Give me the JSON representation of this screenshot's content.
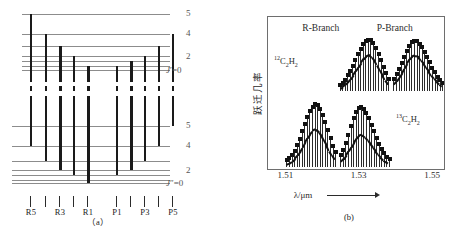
{
  "figure": {
    "panel_a": {
      "caption": "（a）",
      "upper_state_labels": [
        {
          "text": "5",
          "level_index": 0
        },
        {
          "text": "4",
          "level_index": 1
        },
        {
          "text": "2",
          "level_index": 3
        }
      ],
      "upper_j_label_italic": "J",
      "upper_j_label_prime": "′",
      "upper_j_label_value": "=0",
      "lower_state_labels": [
        {
          "text": "5",
          "level_index": 0
        },
        {
          "text": "4",
          "level_index": 1
        },
        {
          "text": "2",
          "level_index": 3
        }
      ],
      "lower_j_label_italic": "J",
      "lower_j_label_prime": "″",
      "lower_j_label_value": "=0",
      "transition_labels": [
        "R5",
        "",
        "R3",
        "",
        "R1",
        "P1",
        "",
        "P3",
        "",
        "P5"
      ],
      "upper_levels": [
        {
          "y": 14,
          "x": 22,
          "w": 148
        },
        {
          "y": 34,
          "x": 22,
          "w": 148
        },
        {
          "y": 46,
          "x": 22,
          "w": 148
        },
        {
          "y": 56,
          "x": 22,
          "w": 148
        },
        {
          "y": 61,
          "x": 22,
          "w": 148
        },
        {
          "y": 66,
          "x": 22,
          "w": 148
        },
        {
          "y": 70,
          "x": 22,
          "w": 148
        }
      ],
      "lower_levels": [
        {
          "y": 126,
          "x": 12,
          "w": 158
        },
        {
          "y": 146,
          "x": 12,
          "w": 158
        },
        {
          "y": 161,
          "x": 12,
          "w": 158
        },
        {
          "y": 170,
          "x": 12,
          "w": 158
        },
        {
          "y": 175,
          "x": 12,
          "w": 158
        },
        {
          "y": 180,
          "x": 12,
          "w": 158
        },
        {
          "y": 183,
          "x": 12,
          "w": 158
        }
      ],
      "transitions": [
        {
          "name": "R5",
          "x": 30,
          "top": 14,
          "bottom": 146,
          "thick": false
        },
        {
          "name": "R4",
          "x": 45,
          "top": 34,
          "bottom": 161,
          "thick": false
        },
        {
          "name": "R3",
          "x": 59,
          "top": 46,
          "bottom": 170,
          "thick": true
        },
        {
          "name": "R2",
          "x": 73,
          "top": 56,
          "bottom": 175,
          "thick": false
        },
        {
          "name": "R1",
          "x": 87,
          "top": 66,
          "bottom": 183,
          "thick": true
        },
        {
          "name": "P1",
          "x": 116,
          "top": 66,
          "bottom": 175,
          "thick": false
        },
        {
          "name": "P2",
          "x": 130,
          "top": 61,
          "bottom": 170,
          "thick": true
        },
        {
          "name": "P3",
          "x": 144,
          "top": 56,
          "bottom": 161,
          "thick": false
        },
        {
          "name": "P4",
          "x": 158,
          "top": 46,
          "bottom": 146,
          "thick": false
        },
        {
          "name": "P5",
          "x": 172,
          "top": 34,
          "bottom": 126,
          "thick": false
        }
      ],
      "tick_y": 196,
      "label_y": 207
    },
    "panel_b": {
      "caption": "(b)",
      "branch_labels": [
        {
          "text": "R-Branch",
          "x": 0.3
        },
        {
          "text": "P-Branch",
          "x": 0.72
        }
      ],
      "isotope_upper": {
        "mass": "12",
        "formula_c": "C",
        "sub_c": "2",
        "formula_h": "H",
        "sub_h": "2"
      },
      "isotope_lower": {
        "mass": "13",
        "formula_c": "C",
        "sub_c": "2",
        "formula_h": "H",
        "sub_h": "2"
      },
      "y_axis_label": "跃迁几率",
      "x_axis_title": "λ/μm",
      "x_ticks": [
        "1.51",
        "1.53",
        "1.55"
      ],
      "x_tick_values": [
        1.51,
        1.53,
        1.55
      ]
    }
  },
  "chart_data": {
    "type": "line",
    "title": "",
    "xlabel": "λ/μm",
    "ylabel": "跃迁几率",
    "xlim": [
      1.505,
      1.553
    ],
    "grid": false,
    "legend": [
      "12C2H2",
      "13C2H2"
    ],
    "series": [
      {
        "name": "12C2H2 R-Branch",
        "trace": "upper",
        "branch": "R-Branch",
        "x": [
          1.5245,
          1.5252,
          1.5259,
          1.5266,
          1.5273,
          1.528,
          1.5287,
          1.5294,
          1.5301,
          1.5308,
          1.5315,
          1.5322,
          1.5329,
          1.5336,
          1.5343,
          1.535,
          1.5357,
          1.5364,
          1.5371,
          1.5378
        ],
        "values": [
          0.1,
          0.14,
          0.2,
          0.28,
          0.37,
          0.47,
          0.58,
          0.69,
          0.79,
          0.88,
          0.94,
          0.97,
          0.96,
          0.9,
          0.81,
          0.7,
          0.57,
          0.44,
          0.32,
          0.22
        ],
        "envelope": [
          0.06,
          0.09,
          0.13,
          0.18,
          0.24,
          0.31,
          0.39,
          0.47,
          0.55,
          0.62,
          0.68,
          0.71,
          0.7,
          0.66,
          0.59,
          0.5,
          0.4,
          0.3,
          0.21,
          0.14
        ]
      },
      {
        "name": "12C2H2 P-Branch",
        "trace": "upper",
        "branch": "P-Branch",
        "x": [
          1.5392,
          1.5399,
          1.5406,
          1.5413,
          1.542,
          1.5427,
          1.5434,
          1.5441,
          1.5448,
          1.5455,
          1.5462,
          1.5469,
          1.5476,
          1.5483,
          1.549,
          1.5497,
          1.5504,
          1.5511,
          1.5518,
          1.5525
        ],
        "values": [
          0.22,
          0.3,
          0.4,
          0.52,
          0.64,
          0.76,
          0.85,
          0.92,
          0.95,
          0.94,
          0.89,
          0.82,
          0.73,
          0.63,
          0.53,
          0.43,
          0.34,
          0.26,
          0.19,
          0.14
        ],
        "envelope": [
          0.14,
          0.2,
          0.27,
          0.35,
          0.44,
          0.53,
          0.61,
          0.67,
          0.7,
          0.69,
          0.66,
          0.6,
          0.54,
          0.46,
          0.39,
          0.31,
          0.25,
          0.19,
          0.14,
          0.1
        ]
      },
      {
        "name": "13C2H2 R-Branch",
        "trace": "lower",
        "branch": "R-Branch",
        "x": [
          1.51,
          1.5107,
          1.5114,
          1.5121,
          1.5128,
          1.5135,
          1.5142,
          1.5149,
          1.5156,
          1.5163,
          1.517,
          1.5177,
          1.5184,
          1.5191,
          1.5198,
          1.5205,
          1.5212,
          1.5219,
          1.5226,
          1.5233
        ],
        "values": [
          0.1,
          0.13,
          0.18,
          0.25,
          0.34,
          0.44,
          0.56,
          0.68,
          0.79,
          0.89,
          0.96,
          1.0,
          0.98,
          0.92,
          0.83,
          0.71,
          0.58,
          0.45,
          0.33,
          0.22
        ],
        "envelope": [
          0.05,
          0.07,
          0.1,
          0.14,
          0.19,
          0.25,
          0.32,
          0.4,
          0.47,
          0.54,
          0.59,
          0.62,
          0.61,
          0.57,
          0.51,
          0.43,
          0.35,
          0.26,
          0.19,
          0.12
        ]
      },
      {
        "name": "13C2H2 P-Branch",
        "trace": "lower",
        "branch": "P-Branch",
        "x": [
          1.5247,
          1.5254,
          1.5261,
          1.5268,
          1.5275,
          1.5282,
          1.5289,
          1.5296,
          1.5303,
          1.531,
          1.5317,
          1.5324,
          1.5331,
          1.5338,
          1.5345,
          1.5352,
          1.5359,
          1.5366,
          1.5373,
          1.538
        ],
        "values": [
          0.18,
          0.26,
          0.37,
          0.5,
          0.64,
          0.77,
          0.87,
          0.93,
          0.95,
          0.92,
          0.86,
          0.77,
          0.67,
          0.56,
          0.45,
          0.36,
          0.28,
          0.21,
          0.15,
          0.11
        ],
        "envelope": [
          0.09,
          0.13,
          0.19,
          0.26,
          0.33,
          0.41,
          0.47,
          0.52,
          0.54,
          0.52,
          0.49,
          0.44,
          0.38,
          0.32,
          0.26,
          0.21,
          0.16,
          0.12,
          0.09,
          0.06
        ]
      }
    ]
  }
}
